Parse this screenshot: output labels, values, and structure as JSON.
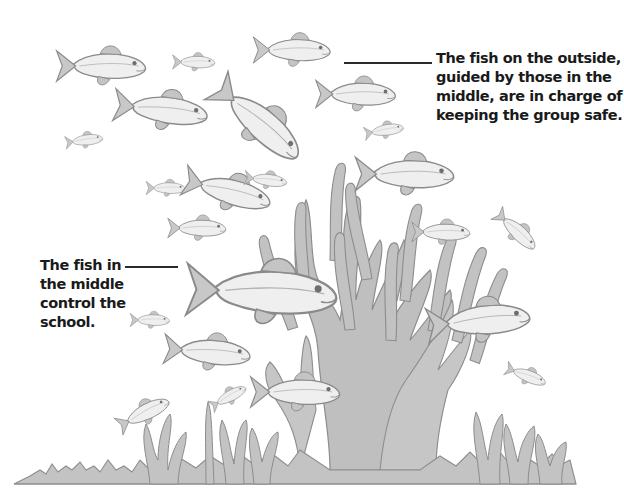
{
  "illustration": {
    "subject": "School of fish swimming around a branching coral",
    "colors": {
      "background": "#ffffff",
      "fish_body": "#efefef",
      "fish_outline": "#8a8a8a",
      "fin_shade": "#b9b9b9",
      "coral_fill": "#bdbdbd",
      "coral_outline": "#8d8d8d",
      "text": "#1a1a1a",
      "leader_line": "#2a2a2a"
    }
  },
  "annotations": {
    "outside": {
      "lines": [
        "The fish on the outside,",
        "guided by those in the",
        "middle, are in charge of",
        "keeping the group safe."
      ]
    },
    "middle": {
      "lines": [
        "The fish in",
        "the middle",
        "control the",
        "school."
      ]
    }
  },
  "icons": {
    "fish": "fish-icon",
    "coral": "coral-icon"
  }
}
